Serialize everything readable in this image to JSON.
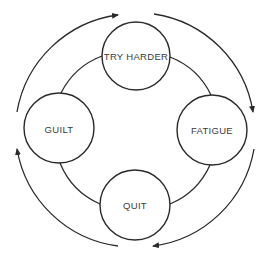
{
  "diagram": {
    "type": "cycle",
    "colors": {
      "line": "#2a2a2a",
      "text": "#3a3a3a",
      "background": "#ffffff"
    },
    "nodes": [
      {
        "id": "try-harder",
        "label": "TRY HARDER",
        "cx": 136,
        "cy": 56,
        "r": 34
      },
      {
        "id": "fatigue",
        "label": "FATIGUE",
        "cx": 212,
        "cy": 130,
        "r": 35
      },
      {
        "id": "quit",
        "label": "QUIT",
        "cx": 135,
        "cy": 205,
        "r": 35
      },
      {
        "id": "guilt",
        "label": "GUILT",
        "cx": 59,
        "cy": 128,
        "r": 35
      }
    ],
    "cycle_direction": "clockwise",
    "flow": [
      "TRY HARDER",
      "FATIGUE",
      "QUIT",
      "GUILT"
    ]
  }
}
